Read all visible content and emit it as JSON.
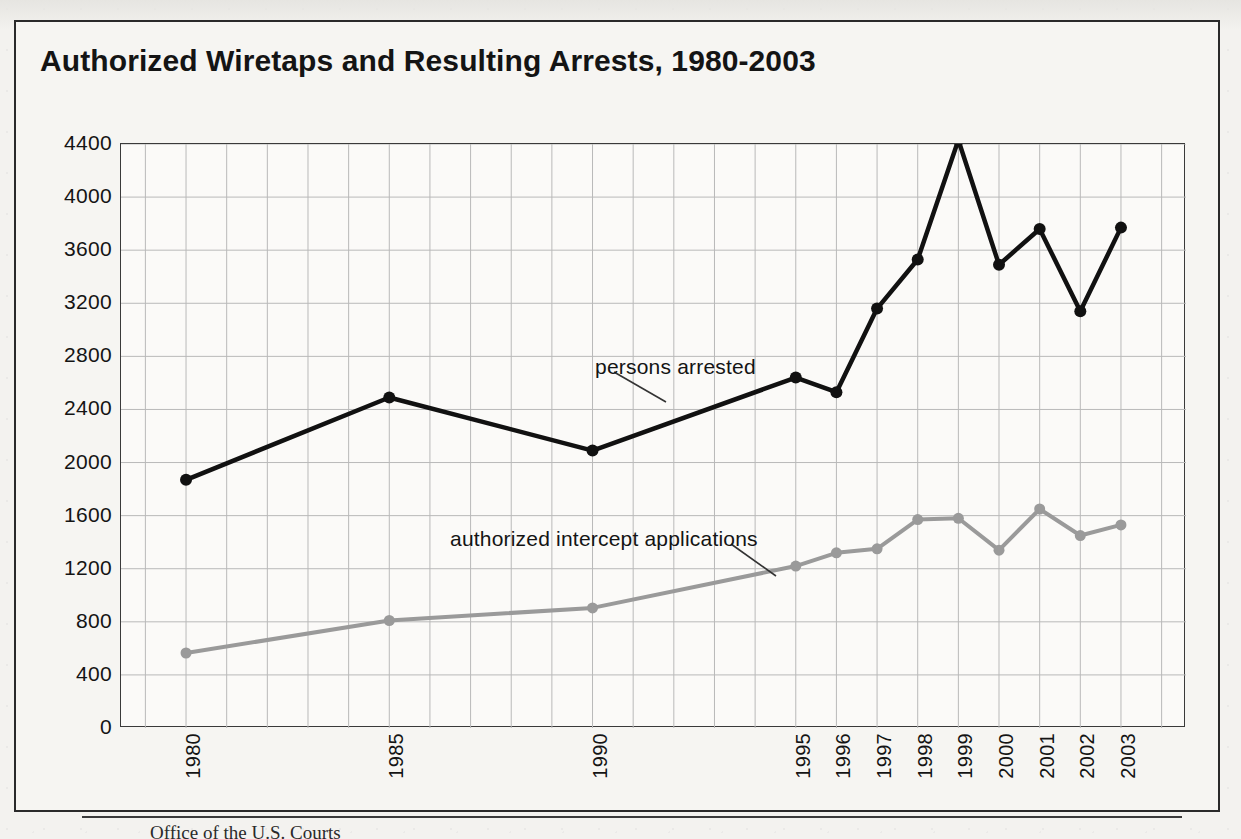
{
  "figure": {
    "title": "Authorized Wiretaps and Resulting Arrests, 1980-2003",
    "source_note": "Office of the U.S. Courts"
  },
  "colors": {
    "arrested_line": "#111111",
    "applications_line": "#9a9a9a",
    "grid": "#b9b9b9",
    "axis": "#3a3a3a",
    "paper": "#f3f2ef",
    "text": "#141414"
  },
  "annotations": {
    "arrested": "persons arrested",
    "applications": "authorized intercept applications"
  },
  "chart_data": {
    "type": "line",
    "title": "Authorized Wiretaps and Resulting Arrests, 1980-2003",
    "xlabel": "",
    "ylabel": "",
    "categories": [
      "1980",
      "1985",
      "1990",
      "1995",
      "1996",
      "1997",
      "1998",
      "1999",
      "2000",
      "2001",
      "2002",
      "2003"
    ],
    "x_positions": [
      1980,
      1985,
      1990,
      1995,
      1996,
      1997,
      1998,
      1999,
      2000,
      2001,
      2002,
      2003
    ],
    "ylim": [
      0,
      4400
    ],
    "yticks": [
      0,
      400,
      800,
      1200,
      1600,
      2000,
      2400,
      2800,
      3200,
      3600,
      4000,
      4400
    ],
    "ytick_labels": [
      "0",
      "400",
      "800",
      "1200",
      "1600",
      "2000",
      "2400",
      "2800",
      "3200",
      "3600",
      "4000",
      "4400"
    ],
    "grid": true,
    "legend": "inline-annotations",
    "series": [
      {
        "name": "persons arrested",
        "color": "#111111",
        "marker": "circle",
        "values": [
          1870,
          2490,
          2090,
          2640,
          2530,
          3160,
          3530,
          4430,
          3490,
          3760,
          3140,
          3770
        ]
      },
      {
        "name": "authorized intercept applications",
        "color": "#9a9a9a",
        "marker": "circle",
        "values": [
          565,
          810,
          905,
          1220,
          1320,
          1350,
          1570,
          1580,
          1340,
          1650,
          1450,
          1530
        ]
      }
    ]
  }
}
